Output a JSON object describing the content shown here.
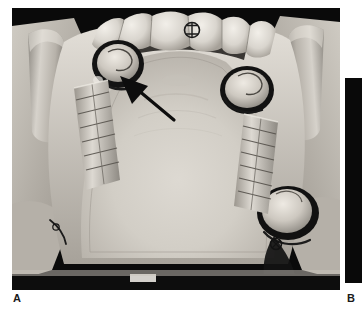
{
  "figure": {
    "type": "clinical-photograph-plate",
    "panels": [
      {
        "id": "A",
        "label": "A",
        "caption_letter": "A",
        "modality": "intraoral color photograph, grayscale reproduction",
        "subject": "maxillary arch, occlusal view",
        "description": "Occlusal view of a maxillary arch retracted by the operator's fingers, showing anterior teeth, two dark-rimmed full-coverage crowns with circumferential clasps on the posterior abutments, bilateral ladder-like metal retention mesh frameworks along the residual ridges, and a broad pale palatal vault.",
        "annotations": [
          {
            "kind": "arrow",
            "name": "pointer-arrow",
            "color": "#0d0d0d",
            "points_to": "left posterior abutment crown margin / clasp arm",
            "direction": "up-left"
          },
          {
            "kind": "tooth-marking",
            "name": "occlusal-contact-marking",
            "location": "maxillary anterior incisor",
            "color": "#1b1b1b"
          }
        ],
        "features": [
          "operator finger retracting left cheek",
          "operator finger retracting right cheek",
          "maxillary anterior teeth",
          "left posterior crown with clasp",
          "right posterior crown with clasp",
          "right molar crown with clasp",
          "left retention mesh framework",
          "right retention mesh framework",
          "palatal vault"
        ],
        "palette": {
          "background": "#0a0a0a",
          "tissue_light": "#d8d4cd",
          "tissue_mid": "#b3aea6",
          "tissue_shadow": "#6e6a64",
          "tooth_highlight": "#efece6",
          "metal_dark": "#151515"
        }
      },
      {
        "id": "B",
        "label": "B",
        "caption_letter": "B",
        "modality": "intraoral color photograph, grayscale reproduction",
        "description": "Adjacent companion photograph, cropped at the right page margin so that only a narrow dark vertical sliver of the image field is visible.",
        "annotations": [],
        "features": [
          "dark image field edge"
        ],
        "palette": {
          "background": "#090909"
        }
      }
    ]
  }
}
